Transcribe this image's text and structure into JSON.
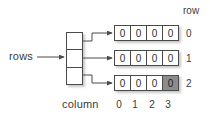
{
  "diagram": {
    "title_labels": {
      "rows_label": "rows",
      "column_label": "column",
      "row_label": "row"
    },
    "colors": {
      "background": "#ffffff",
      "stroke": "#4a4a4a",
      "text": "#3b3b3b",
      "shaded_cell": "#8c8c8c"
    },
    "pointer_array": {
      "name": "rows",
      "cell_count": 3,
      "cells": [
        "",
        "",
        ""
      ]
    },
    "row_indices": [
      "0",
      "1",
      "2"
    ],
    "column_indices": [
      "0",
      "1",
      "2",
      "3"
    ],
    "rows": [
      {
        "index": "0",
        "values": [
          "0",
          "0",
          "0",
          "0"
        ],
        "shaded": [
          false,
          false,
          false,
          false
        ]
      },
      {
        "index": "1",
        "values": [
          "0",
          "0",
          "0",
          "0"
        ],
        "shaded": [
          false,
          false,
          false,
          false
        ]
      },
      {
        "index": "2",
        "values": [
          "0",
          "0",
          "0",
          "0"
        ],
        "shaded": [
          false,
          false,
          false,
          true
        ]
      }
    ]
  }
}
